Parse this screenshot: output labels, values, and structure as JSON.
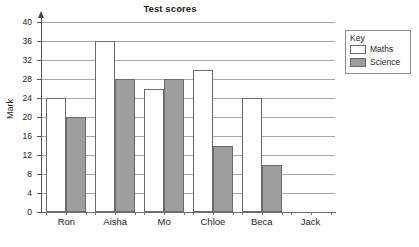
{
  "chart_data": {
    "type": "bar",
    "title": "Test scores",
    "xlabel": "",
    "ylabel": "Mark",
    "categories": [
      "Ron",
      "Aisha",
      "Mo",
      "Chloe",
      "Beca",
      "Jack"
    ],
    "series": [
      {
        "name": "Maths",
        "values": [
          24,
          36,
          26,
          30,
          24,
          0
        ],
        "color": "#ffffff"
      },
      {
        "name": "Science",
        "values": [
          20,
          28,
          28,
          14,
          10,
          0
        ],
        "color": "#9e9e9e"
      }
    ],
    "ylim": [
      0,
      40
    ],
    "ytick_step": 4,
    "yticks": [
      0,
      4,
      8,
      12,
      16,
      20,
      24,
      28,
      32,
      36,
      40
    ],
    "ytick_labels": [
      "0",
      "4",
      "8",
      "12",
      "16",
      "20",
      "24",
      "28",
      "32",
      "36",
      "40"
    ],
    "grid": true,
    "grid_axis": "y",
    "legend": {
      "title": "Key",
      "position": "right-top",
      "entries": [
        {
          "label": "Maths",
          "swatch": "white"
        },
        {
          "label": "Science",
          "swatch": "gray"
        }
      ]
    }
  }
}
